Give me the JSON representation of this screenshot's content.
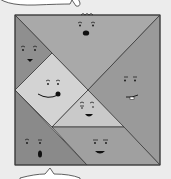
{
  "figure": {
    "background": "#ececec",
    "stroke": "#3a3a3a"
  },
  "pieces": [
    {
      "id": "top-large-triangle",
      "points": "15,15 160,15 88,90",
      "fill": "#a9a9a9"
    },
    {
      "id": "left-small-triangle",
      "points": "15,15 52,53 15,90",
      "fill": "#8f8f8f"
    },
    {
      "id": "square-piece",
      "points": "52,53 88,90 52,127 15,90",
      "fill": "#d3d3d3"
    },
    {
      "id": "right-large-triangle",
      "points": "160,15 160,165 88,90",
      "fill": "#9a9a9a"
    },
    {
      "id": "small-center-triangle",
      "points": "88,90 124,127 52,127",
      "fill": "#c9c9c9"
    },
    {
      "id": "bottom-left-medium-triangle",
      "points": "15,90 87,165 15,165",
      "fill": "#8a8a8a"
    },
    {
      "id": "parallelogram",
      "points": "52,127 124,127 160,165 87,165",
      "fill": "#a0a0a0"
    }
  ],
  "bubbles": {
    "top": {
      "fill": "#ffffff"
    },
    "bottom": {
      "fill": "#ffffff"
    }
  }
}
